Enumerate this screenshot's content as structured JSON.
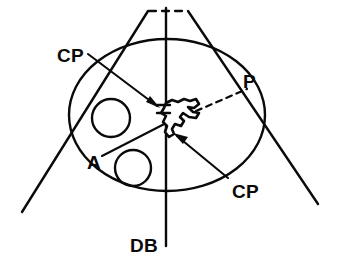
{
  "figure": {
    "type": "line-art-diagram",
    "background_color": "#ffffff",
    "stroke_color": "#0a0a0a",
    "labels": {
      "cp_upper": "CP",
      "cp_lower": "CP",
      "p": "P",
      "a": "A",
      "db": "DB"
    },
    "icon_names": {
      "arrow_upper": "arrow-pointing-right-down-icon",
      "arrow_lower": "arrow-pointing-up-left-icon",
      "leader_p": "dashed-leader-line-icon",
      "apex_dash": "dashed-apex-segment-icon"
    },
    "elements": {
      "oval_label": "large-oval-outline",
      "circle_upper_label": "small-circle-upper",
      "circle_lower_label": "small-circle-lower",
      "axis_label": "vertical-axis-line",
      "cone_left_label": "cone-left-ray",
      "cone_right_label": "cone-right-ray",
      "blob_label": "irregular-central-blob",
      "bracket_label": "double-tick-marker"
    }
  }
}
